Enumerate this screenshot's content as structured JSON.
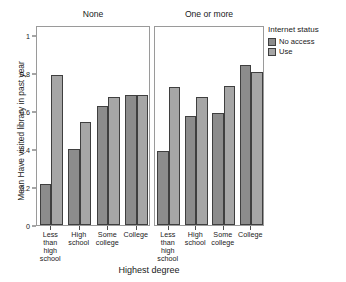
{
  "chart_data": {
    "type": "bar",
    "title": "",
    "xlabel": "Highest degree",
    "ylabel": "Mean Have visited library in past year",
    "ylim": [
      0,
      1.05
    ],
    "ytick_labels": [
      "0",
      "0.2",
      "0.4",
      "0.6",
      "0.8",
      "1"
    ],
    "ytick_values": [
      0,
      0.2,
      0.4,
      0.6,
      0.8,
      1
    ],
    "grid": false,
    "legend_position": "right",
    "legend_title": "Internet status",
    "categories": [
      "Less\nthan\nhigh\nschool",
      "High\nschool",
      "Some\ncollege",
      "College"
    ],
    "panel_variable": "Number of children",
    "panels": [
      {
        "label": "None",
        "series": [
          {
            "name": "No access",
            "values": [
              0.215,
              0.4,
              0.625,
              0.685
            ]
          },
          {
            "name": "Use",
            "values": [
              0.79,
              0.54,
              0.67,
              0.68
            ]
          }
        ]
      },
      {
        "label": "One or more",
        "series": [
          {
            "name": "No access",
            "values": [
              0.39,
              0.57,
              0.59,
              0.84
            ]
          },
          {
            "name": "Use",
            "values": [
              0.725,
              0.67,
              0.73,
              0.805
            ]
          }
        ]
      }
    ],
    "colors": {
      "no_access": "#8c8c8c",
      "use": "#a6a6a6",
      "bar_outline": "#3f3f3f",
      "panel_border": "#9a9a9a",
      "axis": "#4d4d4d",
      "background": "#ffffff"
    }
  },
  "legend": {
    "title": "Internet status",
    "entries": [
      "No access",
      "Use"
    ]
  },
  "axes": {
    "x_title": "Highest degree",
    "y_title": "Mean Have visited library in past year"
  }
}
